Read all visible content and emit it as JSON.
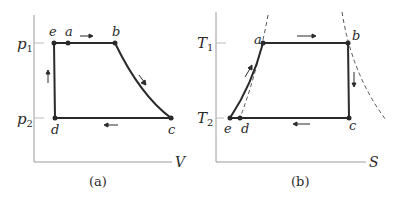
{
  "panel_a": {
    "caption": "(a)",
    "x_axis_label": "V",
    "y_ticks": [
      {
        "label": "p",
        "sub": "1"
      },
      {
        "label": "p",
        "sub": "2"
      }
    ],
    "points": {
      "e": "e",
      "a": "a",
      "b": "b",
      "c": "c",
      "d": "d"
    }
  },
  "panel_b": {
    "caption": "(b)",
    "x_axis_label": "S",
    "y_ticks": [
      {
        "label": "T",
        "sub": "1"
      },
      {
        "label": "T",
        "sub": "2"
      }
    ],
    "points": {
      "a": "a",
      "b": "b",
      "c": "c",
      "d": "d",
      "e": "e"
    }
  },
  "colors": {
    "line": "#2a2a2a",
    "axis": "#9a9a9a",
    "dashed": "#555555"
  }
}
